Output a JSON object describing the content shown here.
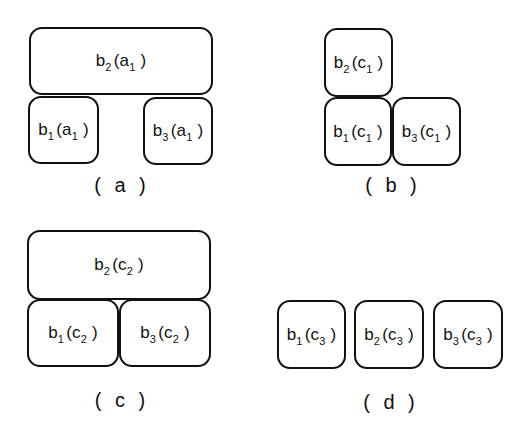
{
  "panels": [
    {
      "caption": "( a )",
      "boxes": [
        {
          "base": "b",
          "base_sub": "2",
          "arg": "a",
          "arg_sub": "1"
        },
        {
          "base": "b",
          "base_sub": "1",
          "arg": "a",
          "arg_sub": "1"
        },
        {
          "base": "b",
          "base_sub": "3",
          "arg": "a",
          "arg_sub": "1"
        }
      ]
    },
    {
      "caption": "( b )",
      "boxes": [
        {
          "base": "b",
          "base_sub": "2",
          "arg": "c",
          "arg_sub": "1"
        },
        {
          "base": "b",
          "base_sub": "1",
          "arg": "c",
          "arg_sub": "1"
        },
        {
          "base": "b",
          "base_sub": "3",
          "arg": "c",
          "arg_sub": "1"
        }
      ]
    },
    {
      "caption": "( c )",
      "boxes": [
        {
          "base": "b",
          "base_sub": "2",
          "arg": "c",
          "arg_sub": "2"
        },
        {
          "base": "b",
          "base_sub": "1",
          "arg": "c",
          "arg_sub": "2"
        },
        {
          "base": "b",
          "base_sub": "3",
          "arg": "c",
          "arg_sub": "2"
        }
      ]
    },
    {
      "caption": "( d )",
      "boxes": [
        {
          "base": "b",
          "base_sub": "1",
          "arg": "c",
          "arg_sub": "3"
        },
        {
          "base": "b",
          "base_sub": "2",
          "arg": "c",
          "arg_sub": "3"
        },
        {
          "base": "b",
          "base_sub": "3",
          "arg": "c",
          "arg_sub": "3"
        }
      ]
    }
  ]
}
